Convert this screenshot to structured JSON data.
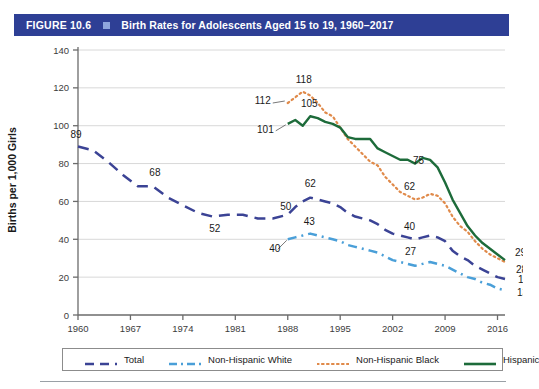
{
  "header": {
    "figure_number": "FIGURE 10.6",
    "square_icon": "square-bullet-icon",
    "title": "Birth Rates for Adolescents Aged 15 to 19, 1960–2017",
    "bar_color": "#2e3f95",
    "square_color": "#8fa6dd"
  },
  "chart_data": {
    "type": "line",
    "title": "Birth Rates for Adolescents Aged 15 to 19, 1960–2017",
    "xlabel": "",
    "ylabel": "Births per 1,000 Girls",
    "xlim": [
      1960,
      2017
    ],
    "ylim": [
      0,
      140
    ],
    "ytick_labels": [
      "0",
      "20",
      "40",
      "60",
      "80",
      "100",
      "120",
      "140"
    ],
    "yticks": [
      0,
      20,
      40,
      60,
      80,
      100,
      120,
      140
    ],
    "xtick_labels": [
      "1960",
      "1967",
      "1974",
      "1981",
      "1988",
      "1995",
      "2002",
      "2009",
      "2016"
    ],
    "xticks": [
      1960,
      1967,
      1974,
      1981,
      1988,
      1995,
      2002,
      2009,
      2016
    ],
    "grid": "horizontal",
    "legend_position": "bottom",
    "series": [
      {
        "name": "Total",
        "color": "#3b4395",
        "style": "dashed",
        "x": [
          1960,
          1962,
          1964,
          1966,
          1968,
          1970,
          1972,
          1974,
          1976,
          1978,
          1980,
          1982,
          1984,
          1986,
          1988,
          1989,
          1990,
          1991,
          1992,
          1993,
          1994,
          1995,
          1996,
          1997,
          1998,
          1999,
          2000,
          2001,
          2002,
          2003,
          2004,
          2005,
          2006,
          2007,
          2008,
          2009,
          2010,
          2011,
          2012,
          2013,
          2014,
          2015,
          2016,
          2017
        ],
        "values": [
          89,
          87,
          81,
          74,
          68,
          68,
          62,
          58,
          54,
          52,
          53,
          53,
          51,
          51,
          53,
          57,
          60,
          62,
          61,
          60,
          59,
          57,
          54,
          52,
          51,
          50,
          48,
          45,
          43,
          42,
          41,
          40,
          41,
          42,
          41,
          39,
          34,
          31,
          29,
          26,
          24,
          22,
          20,
          19
        ],
        "labels": [
          {
            "x": 1960,
            "value": 89
          },
          {
            "x": 1970,
            "value": 68
          },
          {
            "x": 1978,
            "value": 52
          },
          {
            "x": 1988,
            "value": 50
          },
          {
            "x": 1991,
            "value": 62
          },
          {
            "x": 2006,
            "value": 40
          },
          {
            "x": 2017,
            "value": 19
          }
        ]
      },
      {
        "name": "Non-Hispanic White",
        "color": "#4a9fd8",
        "style": "dash-dot",
        "x": [
          1988,
          1989,
          1990,
          1991,
          1992,
          1993,
          1994,
          1995,
          1996,
          1997,
          1998,
          1999,
          2000,
          2001,
          2002,
          2003,
          2004,
          2005,
          2006,
          2007,
          2008,
          2009,
          2010,
          2011,
          2012,
          2013,
          2014,
          2015,
          2016,
          2017
        ],
        "values": [
          40,
          41,
          42,
          43,
          42,
          41,
          40,
          39,
          37,
          36,
          35,
          34,
          33,
          31,
          29,
          28,
          27,
          26,
          27,
          28,
          27,
          26,
          24,
          22,
          20,
          19,
          17,
          16,
          14,
          13
        ],
        "labels": [
          {
            "x": 1988,
            "value": 40
          },
          {
            "x": 1991,
            "value": 43
          },
          {
            "x": 2006,
            "value": 27
          },
          {
            "x": 2017,
            "value": 13
          }
        ]
      },
      {
        "name": "Non-Hispanic Black",
        "color": "#e08a4a",
        "style": "dotted",
        "x": [
          1988,
          1989,
          1990,
          1991,
          1992,
          1993,
          1994,
          1995,
          1996,
          1997,
          1998,
          1999,
          2000,
          2001,
          2002,
          2003,
          2004,
          2005,
          2006,
          2007,
          2008,
          2009,
          2010,
          2011,
          2012,
          2013,
          2014,
          2015,
          2016,
          2017
        ],
        "values": [
          112,
          115,
          118,
          116,
          112,
          107,
          105,
          99,
          93,
          89,
          85,
          81,
          79,
          73,
          69,
          65,
          63,
          61,
          62,
          64,
          63,
          59,
          52,
          47,
          44,
          39,
          35,
          32,
          30,
          28
        ],
        "labels": [
          {
            "x": 1988,
            "value": 112
          },
          {
            "x": 1990,
            "value": 118
          },
          {
            "x": 2006,
            "value": 62
          },
          {
            "x": 2017,
            "value": 28
          }
        ]
      },
      {
        "name": "Hispanic",
        "color": "#1d6b3a",
        "style": "solid",
        "x": [
          1988,
          1989,
          1990,
          1991,
          1992,
          1993,
          1994,
          1995,
          1996,
          1997,
          1998,
          1999,
          2000,
          2001,
          2002,
          2003,
          2004,
          2005,
          2006,
          2007,
          2008,
          2009,
          2010,
          2011,
          2012,
          2013,
          2014,
          2015,
          2016,
          2017
        ],
        "values": [
          101,
          103,
          100,
          105,
          104,
          102,
          101,
          99,
          94,
          93,
          93,
          93,
          88,
          86,
          84,
          82,
          82,
          80,
          83,
          82,
          78,
          70,
          61,
          54,
          47,
          42,
          38,
          35,
          32,
          29
        ],
        "labels": [
          {
            "x": 1988,
            "value": 101
          },
          {
            "x": 1991,
            "value": 105
          },
          {
            "x": 2006,
            "value": 75
          },
          {
            "x": 2017,
            "value": 29
          }
        ]
      }
    ]
  },
  "legend": {
    "items": [
      {
        "label": "Total",
        "color": "#3b4395",
        "style": "dashed"
      },
      {
        "label": "Non-Hispanic White",
        "color": "#4a9fd8",
        "style": "dash-dot"
      },
      {
        "label": "Non-Hispanic Black",
        "color": "#e08a4a",
        "style": "dotted"
      },
      {
        "label": "Hispanic",
        "color": "#1d6b3a",
        "style": "solid"
      }
    ]
  }
}
